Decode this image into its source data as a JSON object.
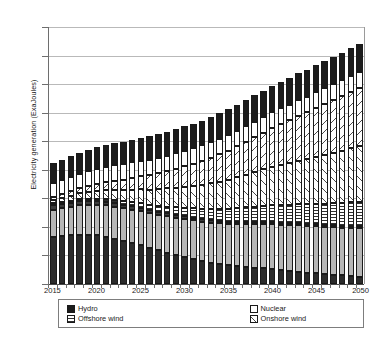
{
  "chart_data": {
    "type": "bar",
    "stacked": true,
    "title": "",
    "xlabel": "",
    "ylabel": "Electricity generation (ExaJoules)",
    "ylim": [
      0,
      180
    ],
    "ytick_step": 20,
    "yticks": [
      0,
      20,
      40,
      60,
      80,
      100,
      120,
      140,
      160,
      180
    ],
    "grid": true,
    "legend_position": "bottom",
    "categories": [
      "2015",
      "2016",
      "2017",
      "2018",
      "2019",
      "2020",
      "2021",
      "2022",
      "2023",
      "2024",
      "2025",
      "2026",
      "2027",
      "2028",
      "2029",
      "2030",
      "2031",
      "2032",
      "2033",
      "2034",
      "2035",
      "2036",
      "2037",
      "2038",
      "2039",
      "2040",
      "2041",
      "2042",
      "2043",
      "2044",
      "2045",
      "2046",
      "2047",
      "2048",
      "2049",
      "2050"
    ],
    "xtick_labels": [
      "2015",
      "2020",
      "2025",
      "2030",
      "2035",
      "2040",
      "2045",
      "2050"
    ],
    "stack_order_bottom_to_top": [
      "Coal",
      "Gas",
      "Oil",
      "Offshore wind",
      "Onshore wind",
      "Solar Panels",
      "Nuclear",
      "Hydro"
    ],
    "series": [
      {
        "name": "Coal",
        "fill": "solid-dark",
        "color": "#2b2b2b",
        "values": [
          33,
          33.5,
          34,
          34.5,
          34.5,
          34,
          33,
          31.5,
          30,
          28.5,
          27,
          25,
          23.5,
          22,
          20.5,
          19,
          17.5,
          16,
          15,
          14,
          13,
          12.5,
          12,
          11.5,
          11,
          10.5,
          9.5,
          9,
          8.5,
          8,
          7.5,
          7,
          6.5,
          6,
          5.5,
          5
        ]
      },
      {
        "name": "Gas",
        "fill": "solid-gray",
        "color": "#b6b6b6",
        "values": [
          19,
          19.5,
          20,
          20.5,
          21,
          21.5,
          22,
          22.5,
          23,
          23.5,
          24,
          24.5,
          25,
          25.5,
          26,
          26.5,
          27,
          27.5,
          28,
          28.5,
          29,
          29.5,
          30,
          30.5,
          31,
          31.5,
          32,
          32,
          32.5,
          32.5,
          33,
          33,
          33.5,
          33.5,
          34,
          34
        ]
      },
      {
        "name": "Oil",
        "fill": "solid-dark",
        "color": "#3c3c3c",
        "values": [
          3,
          3,
          3,
          3,
          2.9,
          2.8,
          2.7,
          2.6,
          2.5,
          2.4,
          2.3,
          2.2,
          2.1,
          2,
          2,
          1.9,
          1.8,
          1.8,
          1.7,
          1.6,
          1.6,
          1.5,
          1.5,
          1.4,
          1.4,
          1.3,
          1.3,
          1.2,
          1.2,
          1.1,
          1.1,
          1,
          1,
          1,
          1,
          1
        ]
      },
      {
        "name": "Offshore wind",
        "fill": "horizontal-stripe",
        "color": "#2f2f2f",
        "values": [
          0.5,
          0.6,
          0.8,
          1,
          1.2,
          1.5,
          1.8,
          2.1,
          2.5,
          2.9,
          3.3,
          3.8,
          4.3,
          4.8,
          5.4,
          6,
          6.6,
          7.2,
          7.8,
          8.4,
          9,
          9.6,
          10.2,
          10.8,
          11.4,
          12,
          12.5,
          13,
          13.5,
          14,
          14.5,
          15,
          15.5,
          16,
          16.5,
          17
        ]
      },
      {
        "name": "Onshore wind",
        "fill": "diagonal-hatch-right",
        "color": "#4a4a4a",
        "values": [
          2.5,
          3,
          3.6,
          4.2,
          4.9,
          5.6,
          6.4,
          7.2,
          8,
          8.9,
          9.8,
          10.7,
          11.7,
          12.7,
          13.7,
          14.8,
          15.9,
          17,
          18.1,
          19.3,
          20.5,
          21.7,
          22.9,
          24.2,
          25.5,
          26.8,
          28,
          29.2,
          30.4,
          31.6,
          32.8,
          34,
          35.2,
          36.4,
          37.6,
          39
        ]
      },
      {
        "name": "Solar Panels",
        "fill": "diagonal-hatch-left",
        "color": "#4a4a4a",
        "values": [
          2,
          2.5,
          3,
          3.6,
          4.2,
          4.9,
          5.6,
          6.4,
          7.2,
          8.1,
          9,
          10,
          11,
          12,
          13.1,
          14.2,
          15.4,
          16.6,
          17.8,
          19.1,
          20.4,
          21.7,
          23,
          24.4,
          25.8,
          27.2,
          28.6,
          30,
          31.4,
          32.8,
          34.2,
          35.6,
          37,
          38.4,
          39.8,
          41
        ]
      },
      {
        "name": "Nuclear",
        "fill": "white",
        "color": "#ffffff",
        "values": [
          10,
          10,
          10,
          10,
          10.2,
          10.4,
          10.6,
          10.8,
          11,
          11,
          11,
          11,
          11,
          11,
          11,
          11,
          11,
          11,
          11,
          11,
          11,
          11,
          11,
          11,
          11,
          11,
          11,
          11,
          11,
          11,
          11,
          11,
          11,
          11,
          11,
          11
        ]
      },
      {
        "name": "Hydro",
        "fill": "solid-black",
        "color": "#1c1c1c",
        "values": [
          14,
          14.2,
          14.4,
          14.6,
          14.8,
          15,
          15.2,
          15.4,
          15.6,
          15.8,
          16,
          16.2,
          16.4,
          16.6,
          16.8,
          17,
          17.2,
          17.4,
          17.6,
          17.8,
          18,
          18.1,
          18.2,
          18.3,
          18.4,
          18.5,
          18.6,
          18.7,
          18.8,
          18.9,
          19,
          19.1,
          19.2,
          19.3,
          19.4,
          19.5
        ]
      }
    ],
    "totals": [
      84,
      86.3,
      88.8,
      91.4,
      93.7,
      95.7,
      97.3,
      98.5,
      99.8,
      101.1,
      102.4,
      103.4,
      104.9,
      106.6,
      108.5,
      110.4,
      112.4,
      114.5,
      116.4,
      118.7,
      120.5,
      122.6,
      124.8,
      127.1,
      129.5,
      131.8,
      133.5,
      135.1,
      137.3,
      139.4,
      141.6,
      143.7,
      145.9,
      147.6,
      149.8,
      151.5
    ]
  },
  "legend": {
    "rows": [
      [
        {
          "label": "Hydro",
          "swatch": "solid-black"
        },
        {
          "label": "Nuclear",
          "swatch": "white"
        },
        {
          "label": "Solar Panels",
          "swatch": "diagonal-hatch-left"
        },
        {
          "label": "Oil",
          "swatch": "solid-dark"
        }
      ],
      [
        {
          "label": "Offshore wind",
          "swatch": "horizontal-stripe"
        },
        {
          "label": "Onshore wind",
          "swatch": "diagonal-hatch-right"
        },
        {
          "label": "Gas",
          "swatch": "solid-gray"
        },
        {
          "label": "Coal",
          "swatch": "solid-dark"
        }
      ]
    ]
  },
  "colors": {
    "coal": "#2b2b2b",
    "gas": "#b6b6b6",
    "oil": "#3c3c3c",
    "offshore_wind": "#2f2f2f",
    "onshore_wind": "#4a4a4a",
    "solar_panels": "#4a4a4a",
    "nuclear": "#ffffff",
    "hydro": "#1c1c1c",
    "gridline": "#b9b9b9",
    "axis": "#6e6e6e",
    "text": "#1a1a1a"
  }
}
